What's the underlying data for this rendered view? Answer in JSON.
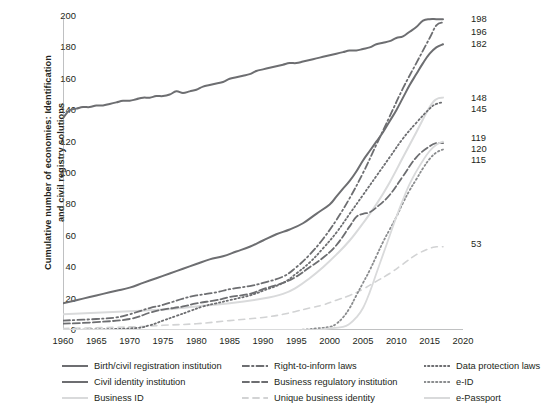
{
  "chart_data": {
    "type": "line",
    "title": "",
    "xlabel": "",
    "ylabel": "Cumulative number of economies: Identification and civil registry solutions",
    "ylabel_line1": "Cumulative number of economies: Identification",
    "ylabel_line2": "and civil registry solutions",
    "xlim": [
      1960,
      2020
    ],
    "ylim": [
      0,
      200
    ],
    "xticks": [
      "1960",
      "1965",
      "1970",
      "1975",
      "1980",
      "1985",
      "1990",
      "1995",
      "2000",
      "2005",
      "2010",
      "2015",
      "2020"
    ],
    "yticks": [
      "0",
      "20",
      "40",
      "60",
      "80",
      "100",
      "120",
      "140",
      "160",
      "180",
      "200"
    ],
    "grid": false,
    "legend_position": "bottom",
    "end_labels": [
      "198",
      "196",
      "182",
      "148",
      "145",
      "119",
      "120",
      "115",
      "53"
    ],
    "series": [
      {
        "name": "Birth/civil registration institution",
        "style": "solid",
        "color": "#6d6e71",
        "width": 2.0,
        "end_value": 198,
        "x": [
          1960,
          1961,
          1962,
          1963,
          1964,
          1965,
          1966,
          1967,
          1968,
          1969,
          1970,
          1971,
          1972,
          1973,
          1974,
          1975,
          1976,
          1977,
          1978,
          1979,
          1980,
          1981,
          1982,
          1983,
          1984,
          1985,
          1986,
          1987,
          1988,
          1989,
          1990,
          1991,
          1992,
          1993,
          1994,
          1995,
          1996,
          1997,
          1998,
          1999,
          2000,
          2001,
          2002,
          2003,
          2004,
          2005,
          2006,
          2007,
          2008,
          2009,
          2010,
          2011,
          2012,
          2013,
          2014,
          2015,
          2016,
          2017
        ],
        "values": [
          135,
          140,
          141,
          142,
          142,
          143,
          143,
          144,
          145,
          146,
          146,
          147,
          148,
          148,
          149,
          149,
          150,
          152,
          151,
          152,
          153,
          155,
          156,
          157,
          158,
          160,
          161,
          162,
          163,
          165,
          166,
          167,
          168,
          169,
          170,
          170,
          171,
          172,
          173,
          174,
          175,
          176,
          177,
          178,
          178,
          179,
          180,
          182,
          183,
          184,
          186,
          187,
          190,
          193,
          197,
          198,
          198,
          198
        ]
      },
      {
        "name": "Civil identity institution",
        "style": "solid",
        "color": "#6d6e71",
        "width": 2.0,
        "end_value": 182,
        "x": [
          1960,
          1962,
          1964,
          1966,
          1968,
          1970,
          1972,
          1974,
          1976,
          1978,
          1980,
          1982,
          1984,
          1986,
          1988,
          1990,
          1992,
          1994,
          1996,
          1998,
          2000,
          2001,
          2002,
          2003,
          2004,
          2005,
          2006,
          2007,
          2008,
          2009,
          2010,
          2011,
          2012,
          2013,
          2014,
          2015,
          2016,
          2017
        ],
        "values": [
          17,
          19,
          21,
          23,
          25,
          27,
          30,
          33,
          36,
          39,
          42,
          45,
          47,
          50,
          53,
          57,
          61,
          64,
          68,
          74,
          80,
          85,
          90,
          95,
          101,
          108,
          114,
          120,
          126,
          133,
          140,
          148,
          156,
          163,
          170,
          176,
          180,
          182
        ]
      },
      {
        "name": "Business ID",
        "style": "solid",
        "color": "#d9dadb",
        "width": 2.0,
        "end_value": 148,
        "x": [
          1960,
          1965,
          1970,
          1975,
          1980,
          1985,
          1990,
          1993,
          1995,
          1997,
          1999,
          2001,
          2003,
          2005,
          2007,
          2009,
          2011,
          2013,
          2015,
          2016,
          2017
        ],
        "values": [
          10,
          11,
          12,
          13,
          15,
          17,
          20,
          23,
          27,
          33,
          40,
          48,
          57,
          68,
          80,
          94,
          110,
          126,
          142,
          147,
          148
        ]
      },
      {
        "name": "Right-to-inform laws",
        "style": "dashdot",
        "color": "#6d6e71",
        "width": 1.8,
        "end_value": 196,
        "x": [
          1960,
          1965,
          1968,
          1970,
          1973,
          1975,
          1978,
          1980,
          1983,
          1985,
          1988,
          1990,
          1993,
          1995,
          1997,
          1999,
          2001,
          2003,
          2005,
          2007,
          2009,
          2011,
          2013,
          2015,
          2016,
          2017
        ],
        "values": [
          6,
          7,
          8,
          10,
          14,
          16,
          20,
          22,
          24,
          26,
          28,
          30,
          34,
          40,
          48,
          58,
          70,
          84,
          100,
          118,
          136,
          154,
          170,
          186,
          194,
          196
        ]
      },
      {
        "name": "Business regulatory institution",
        "style": "dashed",
        "color": "#6d6e71",
        "width": 1.8,
        "end_value": 119,
        "x": [
          1960,
          1965,
          1970,
          1973,
          1975,
          1978,
          1980,
          1983,
          1985,
          1988,
          1990,
          1993,
          1995,
          1997,
          1999,
          2001,
          2003,
          2004,
          2005,
          2006,
          2007,
          2009,
          2011,
          2013,
          2015,
          2016,
          2017
        ],
        "values": [
          4,
          5,
          7,
          11,
          13,
          15,
          17,
          19,
          21,
          23,
          26,
          30,
          34,
          40,
          46,
          54,
          66,
          72,
          74,
          75,
          78,
          86,
          98,
          110,
          117,
          119,
          119
        ]
      },
      {
        "name": "Unique business identity",
        "style": "dashed-light",
        "color": "#d2d3d4",
        "width": 1.6,
        "end_value": 53,
        "x": [
          1960,
          1970,
          1975,
          1980,
          1985,
          1990,
          1993,
          1995,
          1997,
          1999,
          2001,
          2003,
          2005,
          2007,
          2009,
          2011,
          2013,
          2015,
          2016,
          2017
        ],
        "values": [
          1,
          2,
          3,
          4,
          6,
          8,
          10,
          12,
          14,
          16,
          19,
          22,
          26,
          31,
          36,
          42,
          48,
          52,
          53,
          53
        ]
      },
      {
        "name": "Data protection laws",
        "style": "dotted",
        "color": "#6d6e71",
        "width": 1.8,
        "end_value": 145,
        "x": [
          1960,
          1970,
          1973,
          1975,
          1977,
          1979,
          1981,
          1983,
          1985,
          1988,
          1990,
          1993,
          1995,
          1997,
          1999,
          2001,
          2003,
          2005,
          2007,
          2009,
          2011,
          2013,
          2015,
          2016,
          2017
        ],
        "values": [
          0,
          1,
          3,
          6,
          9,
          12,
          15,
          17,
          19,
          22,
          25,
          30,
          36,
          43,
          52,
          62,
          74,
          86,
          98,
          110,
          122,
          132,
          141,
          144,
          145
        ]
      },
      {
        "name": "e-ID",
        "style": "dotted",
        "color": "#8a8c8e",
        "width": 1.8,
        "end_value": 115,
        "x": [
          1960,
          1990,
          1995,
          1998,
          2000,
          2001,
          2002,
          2003,
          2004,
          2005,
          2006,
          2007,
          2008,
          2009,
          2010,
          2011,
          2012,
          2013,
          2014,
          2015,
          2016,
          2017
        ],
        "values": [
          0,
          0,
          0,
          1,
          2,
          4,
          8,
          14,
          22,
          30,
          38,
          47,
          56,
          64,
          72,
          81,
          89,
          96,
          103,
          109,
          113,
          115
        ]
      },
      {
        "name": "e-Passport",
        "style": "solid-light",
        "color": "#d9dadb",
        "width": 1.8,
        "end_value": 120,
        "x": [
          1960,
          1995,
          1998,
          2000,
          2002,
          2003,
          2004,
          2005,
          2006,
          2007,
          2008,
          2009,
          2010,
          2011,
          2012,
          2013,
          2014,
          2015,
          2016,
          2017
        ],
        "values": [
          0,
          0,
          0,
          1,
          2,
          4,
          8,
          14,
          24,
          36,
          48,
          60,
          72,
          83,
          93,
          101,
          108,
          114,
          118,
          120
        ]
      }
    ]
  },
  "legend": {
    "columns": [
      [
        {
          "label": "Birth/civil registration institution",
          "key": "solid",
          "color": "#6d6e71"
        },
        {
          "label": "Civil identity institution",
          "key": "solid",
          "color": "#6d6e71"
        },
        {
          "label": "Business ID",
          "key": "solid-light",
          "color": "#d9dadb"
        }
      ],
      [
        {
          "label": "Right-to-inform laws",
          "key": "dashdot",
          "color": "#6d6e71"
        },
        {
          "label": "Business regulatory institution",
          "key": "dashed",
          "color": "#6d6e71"
        },
        {
          "label": "Unique business identity",
          "key": "dashed-light",
          "color": "#d2d3d4"
        }
      ],
      [
        {
          "label": "Data protection laws",
          "key": "dotted",
          "color": "#6d6e71"
        },
        {
          "label": "e-ID",
          "key": "dotted",
          "color": "#8a8c8e"
        },
        {
          "label": "e-Passport",
          "key": "solid-light",
          "color": "#d9dadb"
        }
      ]
    ]
  },
  "end_annotations": [
    {
      "value": "198",
      "y": 198
    },
    {
      "value": "196",
      "y": 190
    },
    {
      "value": "182",
      "y": 182
    },
    {
      "value": "148",
      "y": 148
    },
    {
      "value": "145",
      "y": 141
    },
    {
      "value": "119",
      "y": 122
    },
    {
      "value": "120",
      "y": 115
    },
    {
      "value": "115",
      "y": 108
    },
    {
      "value": "53",
      "y": 55
    }
  ]
}
